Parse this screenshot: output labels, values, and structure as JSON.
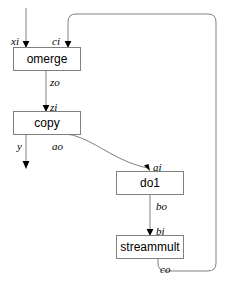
{
  "diagram": {
    "colors": {
      "box_stroke": "#808080",
      "box_fill": "#ffffff",
      "edge": "#808080",
      "arrow": "#000000",
      "text": "#000000",
      "background": "#ffffff"
    },
    "nodes": [
      {
        "id": "omerge",
        "label": "omerge",
        "x": 13,
        "y": 47,
        "w": 67,
        "h": 23
      },
      {
        "id": "copy",
        "label": "copy",
        "x": 13,
        "y": 111,
        "w": 67,
        "h": 23
      },
      {
        "id": "do1",
        "label": "do1",
        "x": 116,
        "y": 171,
        "w": 67,
        "h": 23
      },
      {
        "id": "streammult",
        "label": "streammult",
        "x": 116,
        "y": 235,
        "w": 67,
        "h": 23
      }
    ],
    "ports": [
      {
        "id": "xi",
        "label": "xi",
        "x": 11,
        "y": 41,
        "node": "omerge",
        "kind": "input"
      },
      {
        "id": "ci",
        "label": "ci",
        "x": 52,
        "y": 41,
        "node": "omerge",
        "kind": "input"
      },
      {
        "id": "zo",
        "label": "zo",
        "x": 50,
        "y": 82,
        "node": "omerge",
        "kind": "output"
      },
      {
        "id": "zi",
        "label": "zi",
        "x": 50,
        "y": 107,
        "node": "copy",
        "kind": "input"
      },
      {
        "id": "y",
        "label": "y",
        "x": 17,
        "y": 146,
        "node": "copy",
        "kind": "output"
      },
      {
        "id": "ao",
        "label": "ao",
        "x": 52,
        "y": 146,
        "node": "copy",
        "kind": "output"
      },
      {
        "id": "ai",
        "label": "ai",
        "x": 153,
        "y": 167,
        "node": "do1",
        "kind": "input"
      },
      {
        "id": "bo",
        "label": "bo",
        "x": 156,
        "y": 206,
        "node": "do1",
        "kind": "output"
      },
      {
        "id": "bi",
        "label": "bi",
        "x": 156,
        "y": 231,
        "node": "streammult",
        "kind": "input"
      },
      {
        "id": "co",
        "label": "co",
        "x": 160,
        "y": 270,
        "node": "streammult",
        "kind": "output"
      }
    ],
    "edges": [
      {
        "id": "edge-xi-in",
        "from": "external",
        "to": "omerge.xi"
      },
      {
        "id": "edge-feedback-ci",
        "from": "streammult.co",
        "to": "omerge.ci"
      },
      {
        "id": "edge-zo-zi",
        "from": "omerge.zo",
        "to": "copy.zi"
      },
      {
        "id": "edge-y-out",
        "from": "copy.y",
        "to": "external"
      },
      {
        "id": "edge-ao-ai",
        "from": "copy.ao",
        "to": "do1.ai"
      },
      {
        "id": "edge-bo-bi",
        "from": "do1.bo",
        "to": "streammult.bi"
      }
    ]
  }
}
